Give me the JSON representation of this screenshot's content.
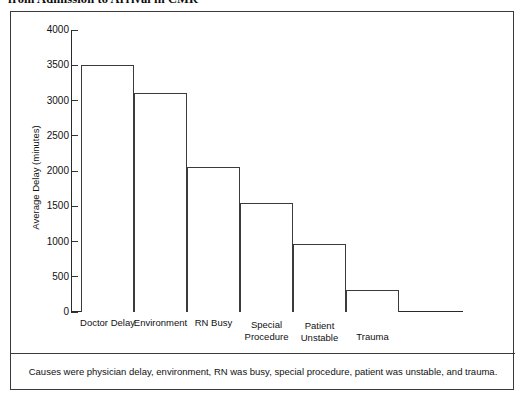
{
  "figure": {
    "title": "from Admission to Arrival in CMR",
    "caption": "Causes were physician delay, environment, RN was busy, special procedure, patient was unstable, and trauma."
  },
  "chart_data": {
    "type": "bar",
    "title": "from Admission to Arrival in CMR",
    "categories": [
      "Doctor Delay",
      "Environment",
      "RN Busy",
      "Special Procedure",
      "Patient Unstable",
      "Trauma"
    ],
    "category_lines": [
      [
        "Doctor Delay"
      ],
      [
        "Environment"
      ],
      [
        "RN Busy"
      ],
      [
        "Special",
        "Procedure"
      ],
      [
        "Patient",
        "Unstable"
      ],
      [
        "Trauma"
      ]
    ],
    "values": [
      3500,
      3100,
      2050,
      1540,
      960,
      310
    ],
    "xlabel": "",
    "ylabel": "Average Delay (minutes)",
    "ylim": [
      0,
      4000
    ],
    "yticks": [
      0,
      500,
      1000,
      1500,
      2000,
      2500,
      3000,
      3500,
      4000
    ],
    "ytick_labels": [
      "0",
      "500",
      "1000",
      "1500",
      "2000",
      "2500",
      "3000",
      "3500",
      "4000"
    ],
    "grid": false,
    "legend": null,
    "bar_fill_color": "#ffffff",
    "bar_edge_color": "#3b3b3b",
    "axis_color": "#2a2a2a"
  }
}
